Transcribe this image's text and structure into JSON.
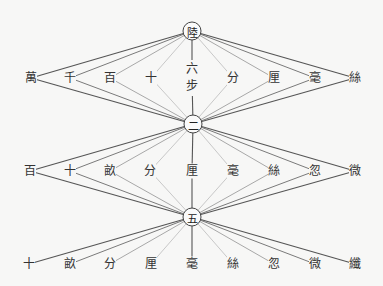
{
  "diagram": {
    "type": "fan-diagram",
    "nodes": [
      {
        "id": "top",
        "label": "陸",
        "x": 192,
        "y": 31
      },
      {
        "id": "mid",
        "label": "二",
        "x": 193,
        "y": 124
      },
      {
        "id": "bot",
        "label": "五",
        "x": 192,
        "y": 217
      }
    ],
    "rows": [
      {
        "y": 78,
        "parent_above": "top",
        "parent_below": "mid",
        "labels": [
          "萬",
          "千",
          "百",
          "十",
          "六步",
          "分",
          "厘",
          "毫",
          "絲"
        ],
        "xs": [
          31,
          70,
          110,
          151,
          192,
          233,
          274,
          315,
          355
        ]
      },
      {
        "y": 171,
        "parent_above": "mid",
        "parent_below": "bot",
        "labels": [
          "百",
          "十",
          "畝",
          "分",
          "厘",
          "毫",
          "絲",
          "忽",
          "微"
        ],
        "xs": [
          30,
          70,
          110,
          150,
          192,
          233,
          274,
          315,
          355
        ]
      },
      {
        "y": 264,
        "parent_above": "bot",
        "parent_below": null,
        "labels": [
          "十",
          "畝",
          "分",
          "厘",
          "毫",
          "絲",
          "忽",
          "微",
          "纖"
        ],
        "xs": [
          29,
          70,
          110,
          151,
          192,
          233,
          274,
          315,
          355
        ]
      }
    ],
    "colors": {
      "background": "#f7f7f6",
      "line_outer": "#555555",
      "line_2": "#7a7a7a",
      "line_3": "#a8a8a8",
      "line_4": "#c8c8c8",
      "line_center": "#555555",
      "text": "#333333"
    }
  }
}
